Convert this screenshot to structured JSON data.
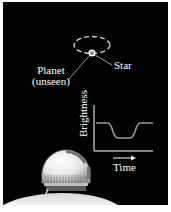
{
  "figure": {
    "background_color": "#000000",
    "labels": {
      "planet": "Planet",
      "planet_note": "(unseen)",
      "star": "Star"
    },
    "graph": {
      "y_axis_label": "Brightness",
      "x_axis_label": "Time",
      "curve_color": "#9a9a9a",
      "axis_color": "#ffffff"
    },
    "icons": {
      "orbit": "dashed-ellipse",
      "star": "circle-dot",
      "telescope": "observatory-dome",
      "time_arrow": "right-arrow"
    }
  }
}
